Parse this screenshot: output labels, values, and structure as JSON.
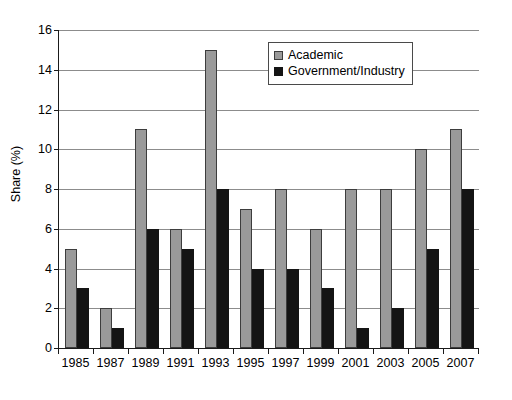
{
  "chart_data": {
    "type": "bar",
    "title": "",
    "xlabel": "",
    "ylabel": "Share (%)",
    "ylim": [
      0,
      16
    ],
    "ytick_step": 2,
    "yticks": [
      0,
      2,
      4,
      6,
      8,
      10,
      12,
      14,
      16
    ],
    "grid": true,
    "legend_position": "top-right-inside",
    "categories": [
      "1985",
      "1987",
      "1989",
      "1991",
      "1993",
      "1995",
      "1997",
      "1999",
      "2001",
      "2003",
      "2005",
      "2007"
    ],
    "series": [
      {
        "name": "Academic",
        "color": "#9a9a9a",
        "values": [
          5,
          2,
          11,
          6,
          15,
          7,
          8,
          6,
          8,
          8,
          10,
          11
        ]
      },
      {
        "name": "Government/Industry",
        "color": "#141414",
        "values": [
          3,
          1,
          6,
          5,
          8,
          4,
          4,
          3,
          1,
          2,
          5,
          8
        ]
      }
    ]
  },
  "legend": {
    "entries": [
      {
        "label": "Academic",
        "swatch": "academic"
      },
      {
        "label": "Government/Industry",
        "swatch": "govind"
      }
    ]
  },
  "colors": {
    "academic": "#9a9a9a",
    "government_industry": "#141414",
    "gridline": "#8c8c8c",
    "axis": "#1a1a1a",
    "background": "#ffffff"
  }
}
